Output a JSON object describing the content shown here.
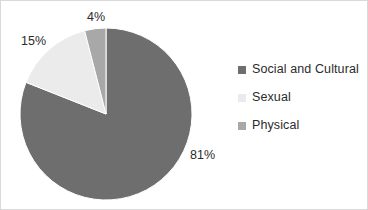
{
  "chart_data": {
    "type": "pie",
    "title": "",
    "categories": [
      "Social and Cultural",
      "Sexual",
      "Physical"
    ],
    "values": [
      81,
      15,
      4
    ],
    "value_labels": [
      "81%",
      "15%",
      "4%"
    ],
    "units": "percent",
    "colors": [
      "#6e6e6e",
      "#ebebeb",
      "#a8a8a8"
    ],
    "legend_position": "right",
    "grid": false,
    "start_angle_deg": 0,
    "direction": "clockwise",
    "slices": [
      {
        "label": "Social and Cultural",
        "value": 81,
        "value_label": "81%",
        "color": "#6e6e6e"
      },
      {
        "label": "Sexual",
        "value": 15,
        "value_label": "15%",
        "color": "#ebebeb"
      },
      {
        "label": "Physical",
        "value": 4,
        "value_label": "4%",
        "color": "#a8a8a8"
      }
    ]
  },
  "legend": {
    "items": [
      {
        "label": "Social and Cultural",
        "color": "#6e6e6e"
      },
      {
        "label": "Sexual",
        "color": "#ebebeb"
      },
      {
        "label": "Physical",
        "color": "#a8a8a8"
      }
    ]
  },
  "labels": {
    "top": "4%",
    "upper_left": "15%",
    "lower_right": "81%"
  },
  "style": {
    "background": "#ffffff",
    "border": "#d9d9d9",
    "text": "#2b2b2b"
  }
}
